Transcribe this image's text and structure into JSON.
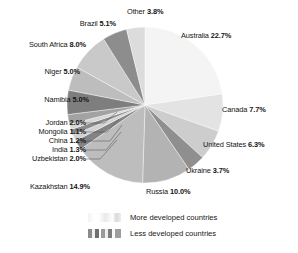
{
  "chart_data": {
    "type": "pie",
    "title": "",
    "subtitle": "",
    "xlabel": "",
    "ylabel": "",
    "legend_position": "bottom",
    "grid": false,
    "units": "percent",
    "categories": [
      "Australia",
      "Canada",
      "United States",
      "Ukraine",
      "Russia",
      "Kazakhstan",
      "Uzbekistan",
      "India",
      "China",
      "Mongolia",
      "Jordan",
      "Namibia",
      "Niger",
      "South Africa",
      "Brazil",
      "Other"
    ],
    "values": [
      22.7,
      7.7,
      6.3,
      3.7,
      10.0,
      14.9,
      2.0,
      1.3,
      1.2,
      1.1,
      2.0,
      5.0,
      5.0,
      8.0,
      5.1,
      3.8
    ],
    "slices": [
      {
        "label": "Australia",
        "value": 22.7,
        "value_text": "22.7%",
        "group": "more",
        "color": "#f4f4f4"
      },
      {
        "label": "Canada",
        "value": 7.7,
        "value_text": "7.7%",
        "group": "more",
        "color": "#e3e3e3"
      },
      {
        "label": "United States",
        "value": 6.3,
        "value_text": "6.3%",
        "group": "more",
        "color": "#cdcdcd"
      },
      {
        "label": "Ukraine",
        "value": 3.7,
        "value_text": "3.7%",
        "group": "less",
        "color": "#8f8f8f"
      },
      {
        "label": "Russia",
        "value": 10.0,
        "value_text": "10.0%",
        "group": "less",
        "color": "#b3b3b3"
      },
      {
        "label": "Kazakhstan",
        "value": 14.9,
        "value_text": "14.9%",
        "group": "less",
        "color": "#bdbdbd"
      },
      {
        "label": "Uzbekistan",
        "value": 2.0,
        "value_text": "2.0%",
        "group": "less",
        "color": "#838383"
      },
      {
        "label": "India",
        "value": 1.3,
        "value_text": "1.3%",
        "group": "less",
        "color": "#d2d2d2"
      },
      {
        "label": "China",
        "value": 1.2,
        "value_text": "1.2%",
        "group": "less",
        "color": "#8a8a8a"
      },
      {
        "label": "Mongolia",
        "value": 1.1,
        "value_text": "1.1%",
        "group": "less",
        "color": "#d6d6d6"
      },
      {
        "label": "Jordan",
        "value": 2.0,
        "value_text": "2.0%",
        "group": "less",
        "color": "#a2a2a2"
      },
      {
        "label": "Namibia",
        "value": 5.0,
        "value_text": "5.0%",
        "group": "less",
        "color": "#7e7e7e"
      },
      {
        "label": "Niger",
        "value": 5.0,
        "value_text": "5.0%",
        "group": "less",
        "color": "#bdbdbd"
      },
      {
        "label": "South Africa",
        "value": 8.0,
        "value_text": "8.0%",
        "group": "less",
        "color": "#c9c9c9"
      },
      {
        "label": "Brazil",
        "value": 5.1,
        "value_text": "5.1%",
        "group": "less",
        "color": "#8d8d8d"
      },
      {
        "label": "Other",
        "value": 3.8,
        "value_text": "3.8%",
        "group": "more",
        "color": "#dcdcdc"
      }
    ],
    "legend": [
      {
        "label": "More developed countries",
        "swatch": "light-gradient"
      },
      {
        "label": "Less developed countries",
        "swatch": "striped-gradient"
      }
    ]
  },
  "labels": {
    "australia": {
      "name": "Australia",
      "value": "22.7%"
    },
    "canada": {
      "name": "Canada",
      "value": "7.7%"
    },
    "united_states": {
      "name": "United States",
      "value": "6.3%"
    },
    "ukraine": {
      "name": "Ukraine",
      "value": "3.7%"
    },
    "russia": {
      "name": "Russia",
      "value": "10.0%"
    },
    "kazakhstan": {
      "name": "Kazakhstan",
      "value": "14.9%"
    },
    "uzbekistan": {
      "name": "Uzbekistan",
      "value": "2.0%"
    },
    "india": {
      "name": "India",
      "value": "1.3%"
    },
    "china": {
      "name": "China",
      "value": "1.2%"
    },
    "mongolia": {
      "name": "Mongolia",
      "value": "1.1%"
    },
    "jordan": {
      "name": "Jordan",
      "value": "2.0%"
    },
    "namibia": {
      "name": "Namibia",
      "value": "5.0%"
    },
    "niger": {
      "name": "Niger",
      "value": "5.0%"
    },
    "south_africa": {
      "name": "South Africa",
      "value": "8.0%"
    },
    "brazil": {
      "name": "Brazil",
      "value": "5.1%"
    },
    "other": {
      "name": "Other",
      "value": "3.8%"
    }
  },
  "legend": {
    "more_label": "More developed countries",
    "less_label": "Less developed countries"
  }
}
